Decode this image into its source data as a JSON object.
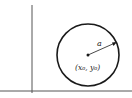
{
  "diagram": {
    "type": "circle-on-axes",
    "center_label": "(x₀, y₀)",
    "radius_label": "a",
    "colors": {
      "stroke": "#1a1a1a",
      "axis": "#555555",
      "background": "#ffffff"
    },
    "geometry": {
      "axis_vertical_x": 32,
      "axis_horizontal_y": 91,
      "circle_cx": 88,
      "circle_cy": 55,
      "circle_r": 31
    }
  }
}
